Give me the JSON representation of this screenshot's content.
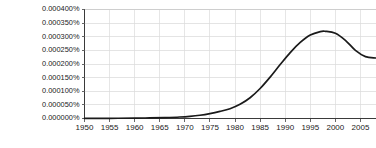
{
  "chart_data": {
    "type": "line",
    "title": "",
    "subtitle": "",
    "xlabel": "",
    "ylabel": "",
    "grid": true,
    "legend": false,
    "legend_position": "none",
    "xlim": [
      1950,
      2008
    ],
    "ylim": [
      0,
      0.0004
    ],
    "x_tick_labels": [
      "1950",
      "1955",
      "1960",
      "1965",
      "1970",
      "1975",
      "1980",
      "1985",
      "1990",
      "1995",
      "2000",
      "2005"
    ],
    "x_ticks": [
      1950,
      1955,
      1960,
      1965,
      1970,
      1975,
      1980,
      1985,
      1990,
      1995,
      2000,
      2005
    ],
    "y_tick_labels": [
      "0.000400%",
      "0.000350%",
      "0.000300%",
      "0.000250%",
      "0.000200%",
      "0.000150%",
      "0.000100%",
      "0.000050%",
      "0.000000%"
    ],
    "y_ticks": [
      0.0004,
      0.00035,
      0.0003,
      0.00025,
      0.0002,
      0.00015,
      0.0001,
      5e-05,
      0.0
    ],
    "y_unit": "%",
    "series": [
      {
        "name": "frequency",
        "color": "#1a1a1a",
        "x": [
          1950,
          1955,
          1960,
          1963,
          1966,
          1969,
          1971,
          1973,
          1975,
          1977,
          1979,
          1981,
          1983,
          1985,
          1987,
          1989,
          1991,
          1993,
          1995,
          1997,
          1998,
          2000,
          2002,
          2004,
          2006,
          2008
        ],
        "values": [
          5e-07,
          8e-07,
          1.5e-06,
          2.2e-06,
          3.5e-06,
          5.5e-06,
          8e-06,
          1.2e-05,
          1.8e-05,
          2.6e-05,
          3.6e-05,
          5.2e-05,
          7.6e-05,
          0.00011,
          0.000152,
          0.000198,
          0.000242,
          0.000279,
          0.000306,
          0.000319,
          0.00032,
          0.000313,
          0.000287,
          0.00025,
          0.000227,
          0.000222
        ]
      }
    ],
    "annotations": []
  },
  "axes": {
    "y_axis_name": "y-axis",
    "x_axis_name": "x-axis"
  },
  "colors": {
    "line": "#1a1a1a",
    "grid": "#d9d9d9",
    "axis": "#3a3a3a",
    "text": "#222222",
    "background": "#ffffff"
  }
}
